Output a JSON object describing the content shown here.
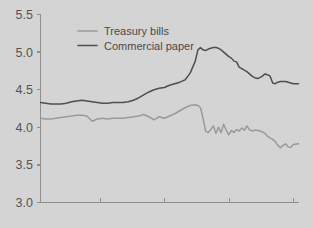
{
  "chart_data": {
    "type": "line",
    "title": "",
    "subtitle": "",
    "xlabel": "",
    "ylabel": "",
    "ylim": [
      3.0,
      5.5
    ],
    "ytick_labels": [
      "5.5",
      "5.0",
      "4.5",
      "4.0",
      "3.5",
      "3.0"
    ],
    "ytick_values": [
      5.5,
      5.0,
      4.5,
      4.0,
      3.5,
      3.0
    ],
    "xlim": [
      0,
      100
    ],
    "xtick_values": [
      23,
      48,
      73,
      98
    ],
    "xtick_labels": [
      "",
      "",
      "",
      ""
    ],
    "grid": false,
    "legend_position": "top-left",
    "series": [
      {
        "name": "Treasury bills",
        "color": "#9a9a9a",
        "x": [
          0,
          2,
          4,
          6,
          8,
          10,
          12,
          14,
          16,
          18,
          20,
          22,
          24,
          26,
          28,
          30,
          32,
          34,
          36,
          38,
          40,
          42,
          44,
          46,
          48,
          50,
          52,
          54,
          56,
          58,
          60,
          61,
          62,
          63,
          64,
          65,
          66,
          67,
          68,
          69,
          70,
          71,
          72,
          73,
          74,
          75,
          76,
          77,
          78,
          79,
          80,
          81,
          82,
          83,
          84,
          85,
          86,
          87,
          88,
          89,
          90,
          91,
          92,
          93,
          94,
          95,
          96,
          97,
          98,
          100
        ],
        "values": [
          4.12,
          4.11,
          4.11,
          4.12,
          4.13,
          4.14,
          4.15,
          4.16,
          4.16,
          4.15,
          4.08,
          4.11,
          4.12,
          4.11,
          4.12,
          4.12,
          4.12,
          4.13,
          4.14,
          4.15,
          4.17,
          4.14,
          4.1,
          4.14,
          4.12,
          4.15,
          4.18,
          4.22,
          4.26,
          4.29,
          4.3,
          4.29,
          4.26,
          4.12,
          3.95,
          3.93,
          3.97,
          4.02,
          3.92,
          4.0,
          3.93,
          4.04,
          3.96,
          3.9,
          3.96,
          3.93,
          3.97,
          3.95,
          3.99,
          3.96,
          4.02,
          3.97,
          3.95,
          3.96,
          3.96,
          3.95,
          3.94,
          3.92,
          3.88,
          3.86,
          3.84,
          3.81,
          3.76,
          3.73,
          3.76,
          3.78,
          3.74,
          3.73,
          3.77,
          3.78
        ]
      },
      {
        "name": "Commercial paper",
        "color": "#4f4f4f",
        "x": [
          0,
          2,
          4,
          6,
          8,
          10,
          12,
          14,
          16,
          18,
          20,
          22,
          24,
          26,
          28,
          30,
          32,
          34,
          36,
          38,
          40,
          42,
          44,
          46,
          48,
          50,
          52,
          54,
          56,
          58,
          60,
          61,
          62,
          63,
          64,
          65,
          66,
          67,
          68,
          69,
          70,
          71,
          72,
          73,
          74,
          75,
          76,
          77,
          78,
          79,
          80,
          81,
          82,
          83,
          84,
          85,
          86,
          87,
          88,
          89,
          90,
          91,
          92,
          93,
          94,
          95,
          96,
          97,
          98,
          100
        ],
        "values": [
          4.33,
          4.32,
          4.31,
          4.31,
          4.31,
          4.32,
          4.34,
          4.35,
          4.36,
          4.35,
          4.34,
          4.33,
          4.32,
          4.32,
          4.33,
          4.33,
          4.33,
          4.34,
          4.36,
          4.39,
          4.43,
          4.47,
          4.5,
          4.52,
          4.53,
          4.56,
          4.58,
          4.6,
          4.63,
          4.72,
          4.88,
          5.03,
          5.06,
          5.03,
          5.02,
          5.04,
          5.05,
          5.06,
          5.06,
          5.05,
          5.03,
          5.0,
          4.97,
          4.94,
          4.92,
          4.88,
          4.87,
          4.8,
          4.78,
          4.76,
          4.74,
          4.71,
          4.68,
          4.66,
          4.65,
          4.66,
          4.68,
          4.71,
          4.7,
          4.68,
          4.59,
          4.58,
          4.6,
          4.61,
          4.61,
          4.61,
          4.6,
          4.59,
          4.58,
          4.58
        ]
      }
    ]
  },
  "legend": {
    "items": [
      {
        "label": "Treasury bills",
        "color": "#9a9a9a"
      },
      {
        "label": "Commercial paper",
        "color": "#4f4f4f"
      }
    ]
  },
  "axis": {
    "color": "#8e8e8e"
  },
  "background": "#d4d4d4"
}
